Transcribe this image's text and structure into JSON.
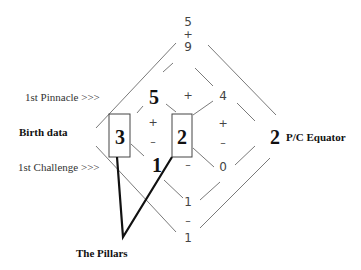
{
  "diagram": {
    "top_sum": {
      "a": "5",
      "op": "+",
      "b": "9"
    },
    "labels": {
      "first_pinnacle": "1st Pinnacle >>>",
      "birth_data": "Birth data",
      "first_challenge": "1st Challenge >>>",
      "pc_equator_label": "P/C Equator",
      "pillars": "The Pillars"
    },
    "pinnacle_row": {
      "left": "5",
      "op": "+",
      "right": "4"
    },
    "birth_row": {
      "left_box": "3",
      "right_box": "2"
    },
    "ops_col_left": {
      "plus": "+",
      "minus": "–"
    },
    "ops_col_right": {
      "plus": "+",
      "minus": "–"
    },
    "challenge_row": {
      "left": "1",
      "op": "–",
      "right": "0"
    },
    "pc_equator_value": "2",
    "bottom": {
      "a": "1",
      "op": "–",
      "b": "1"
    },
    "colors": {
      "line": "#777777",
      "pillar": "#111111",
      "box": "#444444"
    }
  }
}
